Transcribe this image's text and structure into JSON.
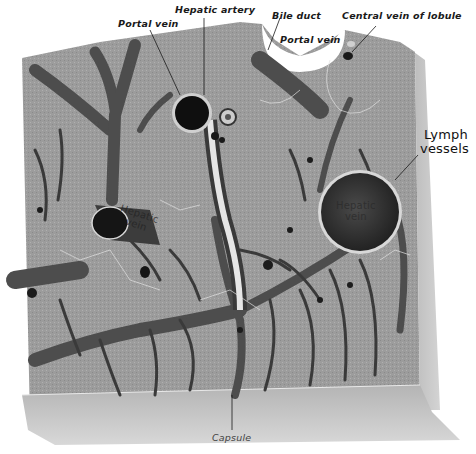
{
  "figure": {
    "colors": {
      "background": "#ffffff",
      "tissue": "#9a9a9a",
      "tissue_light": "#b8b8b8",
      "vessel": "#4a4a4a",
      "vessel_dark": "#1e1e1e",
      "capsule": "#c4c4c4",
      "label_text": "#1a1a1a"
    }
  },
  "labels": {
    "portal_vein_left": "Portal vein",
    "hepatic_artery": "Hepatic artery",
    "bile_duct": "Bile duct",
    "portal_vein_right": "Portal vein",
    "central_vein_of_lobule": "Central vein of lobule",
    "lymph_vessels_line1": "Lymph",
    "lymph_vessels_line2": "vessels",
    "hepatic_vein_large_line1": "Hepatic",
    "hepatic_vein_large_line2": "vein",
    "hepatic_vein_small_line1": "Hepatic",
    "hepatic_vein_small_line2": "vein",
    "capsule": "Capsule"
  }
}
